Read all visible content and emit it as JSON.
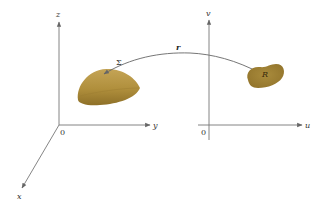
{
  "diagram": {
    "left_axes": {
      "origin_label": "0",
      "x_label": "x",
      "y_label": "y",
      "z_label": "z"
    },
    "right_axes": {
      "origin_label": "0",
      "u_label": "u",
      "v_label": "v"
    },
    "surface": {
      "label": "Σ",
      "color": "#b08f3c"
    },
    "region": {
      "label": "R",
      "color": "#a08334"
    },
    "mapping": {
      "label": "r"
    },
    "colors": {
      "axis": "#777777",
      "curve": "#666666",
      "text": "#333333"
    }
  }
}
